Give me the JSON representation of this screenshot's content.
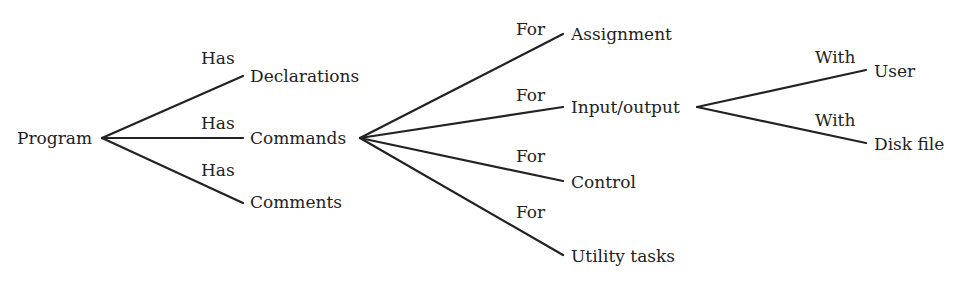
{
  "diagram": {
    "type": "tree",
    "line_color": "#222222",
    "nodes": {
      "program": "Program",
      "declarations": "Declarations",
      "commands": "Commands",
      "comments": "Comments",
      "assignment": "Assignment",
      "input_output": "Input/output",
      "control": "Control",
      "utility_tasks": "Utility tasks",
      "user": "User",
      "disk_file": "Disk file"
    },
    "edge_labels": {
      "program_declarations": "Has",
      "program_commands": "Has",
      "program_comments": "Has",
      "commands_assignment": "For",
      "commands_input_output": "For",
      "commands_control": "For",
      "commands_utility_tasks": "For",
      "input_output_user": "With",
      "input_output_disk_file": "With"
    },
    "edges": [
      {
        "from": "Program",
        "to": "Declarations",
        "label": "Has"
      },
      {
        "from": "Program",
        "to": "Commands",
        "label": "Has"
      },
      {
        "from": "Program",
        "to": "Comments",
        "label": "Has"
      },
      {
        "from": "Commands",
        "to": "Assignment",
        "label": "For"
      },
      {
        "from": "Commands",
        "to": "Input/output",
        "label": "For"
      },
      {
        "from": "Commands",
        "to": "Control",
        "label": "For"
      },
      {
        "from": "Commands",
        "to": "Utility tasks",
        "label": "For"
      },
      {
        "from": "Input/output",
        "to": "User",
        "label": "With"
      },
      {
        "from": "Input/output",
        "to": "Disk file",
        "label": "With"
      }
    ]
  }
}
